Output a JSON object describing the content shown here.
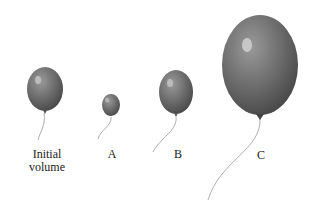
{
  "figure": {
    "balloons": [
      {
        "id": "initial",
        "label_line1": "Initial",
        "label_line2": "volume",
        "size": "medium"
      },
      {
        "id": "A",
        "label": "A",
        "size": "small"
      },
      {
        "id": "B",
        "label": "B",
        "size": "medium"
      },
      {
        "id": "C",
        "label": "C",
        "size": "large"
      }
    ],
    "colors": {
      "balloon": "#6e6e6e",
      "highlight": "#d8d8d8",
      "string": "#999999"
    }
  }
}
